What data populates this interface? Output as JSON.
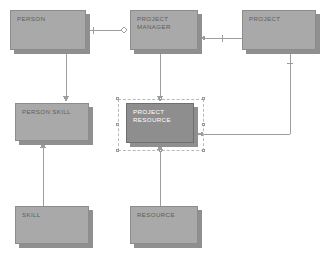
{
  "diagram": {
    "type": "entity-relationship-diagram",
    "background_color": "#ffffff",
    "entity_fill": "#a9a9a9",
    "entity_selected_fill": "#8e8e8e",
    "entity_border": "#8c8c8c",
    "shadow_color": "#8f8f8f",
    "line_color": "#9d9d9d",
    "selection_border": "#b9b9b9",
    "entities": [
      {
        "id": "person",
        "label": "PERSON",
        "x": 10,
        "y": 10,
        "w": 76,
        "h": 40,
        "selected": false
      },
      {
        "id": "project-manager",
        "label": "PROJECT\nMANAGER",
        "x": 130,
        "y": 10,
        "w": 68,
        "h": 40,
        "selected": false
      },
      {
        "id": "project",
        "label": "PROJECT",
        "x": 242,
        "y": 10,
        "w": 74,
        "h": 40,
        "selected": false
      },
      {
        "id": "person-skill",
        "label": "PERSON SKILL",
        "x": 15,
        "y": 103,
        "w": 74,
        "h": 38,
        "selected": false
      },
      {
        "id": "project-resource",
        "label": "PROJECT\nRESOURCE",
        "x": 126,
        "y": 103,
        "w": 68,
        "h": 40,
        "selected": true
      },
      {
        "id": "skill",
        "label": "SKILL",
        "x": 15,
        "y": 206,
        "w": 74,
        "h": 38,
        "selected": false
      },
      {
        "id": "resource",
        "label": "RESOURCE",
        "x": 130,
        "y": 206,
        "w": 68,
        "h": 38,
        "selected": false
      }
    ],
    "selection": {
      "target": "project-resource",
      "x": 118,
      "y": 99,
      "w": 86,
      "h": 52,
      "handles": [
        {
          "x": 116,
          "y": 97
        },
        {
          "x": 159,
          "y": 97
        },
        {
          "x": 202,
          "y": 97
        },
        {
          "x": 116,
          "y": 123
        },
        {
          "x": 202,
          "y": 123
        },
        {
          "x": 116,
          "y": 149
        },
        {
          "x": 159,
          "y": 149
        },
        {
          "x": 202,
          "y": 149
        }
      ]
    },
    "connectors": [
      {
        "id": "person-to-project-manager",
        "from": "person",
        "to": "project-manager",
        "style": "optional-one"
      },
      {
        "id": "project-manager-to-project",
        "from": "project",
        "to": "project-manager",
        "style": "arrow-left"
      },
      {
        "id": "person-to-person-skill",
        "from": "person",
        "to": "person-skill",
        "style": "arrow-down"
      },
      {
        "id": "skill-to-person-skill",
        "from": "skill",
        "to": "person-skill",
        "style": "arrow-up"
      },
      {
        "id": "pm-to-project-resource",
        "from": "project-manager",
        "to": "project-resource",
        "style": "arrow-down"
      },
      {
        "id": "resource-to-project-resource",
        "from": "resource",
        "to": "project-resource",
        "style": "arrow-up"
      },
      {
        "id": "project-to-project-resource",
        "from": "project",
        "to": "project-resource",
        "style": "orthogonal-arrow-left"
      }
    ]
  }
}
